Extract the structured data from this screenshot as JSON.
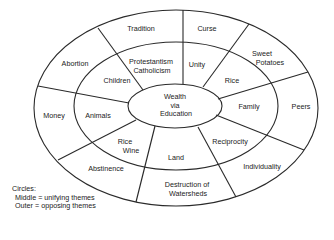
{
  "diagram": {
    "center": {
      "line1": "Wealth",
      "line2": "via",
      "line3": "Education"
    },
    "middle_ring": [
      {
        "id": "protestantism",
        "line1": "Protestantism",
        "line2": "Catholicism"
      },
      {
        "id": "unity",
        "line1": "Unity"
      },
      {
        "id": "rice",
        "line1": "Rice"
      },
      {
        "id": "family",
        "line1": "Family"
      },
      {
        "id": "reciprocity",
        "line1": "Reciprocity"
      },
      {
        "id": "land",
        "line1": "Land"
      },
      {
        "id": "rice-wine",
        "line1": "Rice",
        "line2": "Wine"
      },
      {
        "id": "animals",
        "line1": "Animals"
      },
      {
        "id": "children",
        "line1": "Children"
      }
    ],
    "outer_ring": [
      {
        "id": "tradition",
        "line1": "Tradition"
      },
      {
        "id": "curse",
        "line1": "Curse"
      },
      {
        "id": "sweet-potatoes",
        "line1": "Sweet",
        "line2": "Potatoes"
      },
      {
        "id": "peers",
        "line1": "Peers"
      },
      {
        "id": "individuality",
        "line1": "Individuality"
      },
      {
        "id": "destruction-of-watersheds",
        "line1": "Destruction of",
        "line2": "Watersheds"
      },
      {
        "id": "abstinence",
        "line1": "Abstinence"
      },
      {
        "id": "money",
        "line1": "Money"
      },
      {
        "id": "abortion",
        "line1": "Abortion"
      }
    ]
  },
  "legend": {
    "title": "Circles:",
    "line1": "Middle = unifying themes",
    "line2": "Outer = opposing themes"
  },
  "colors": {
    "stroke": "#2a2a2a",
    "text": "#222222",
    "background": "#ffffff"
  }
}
